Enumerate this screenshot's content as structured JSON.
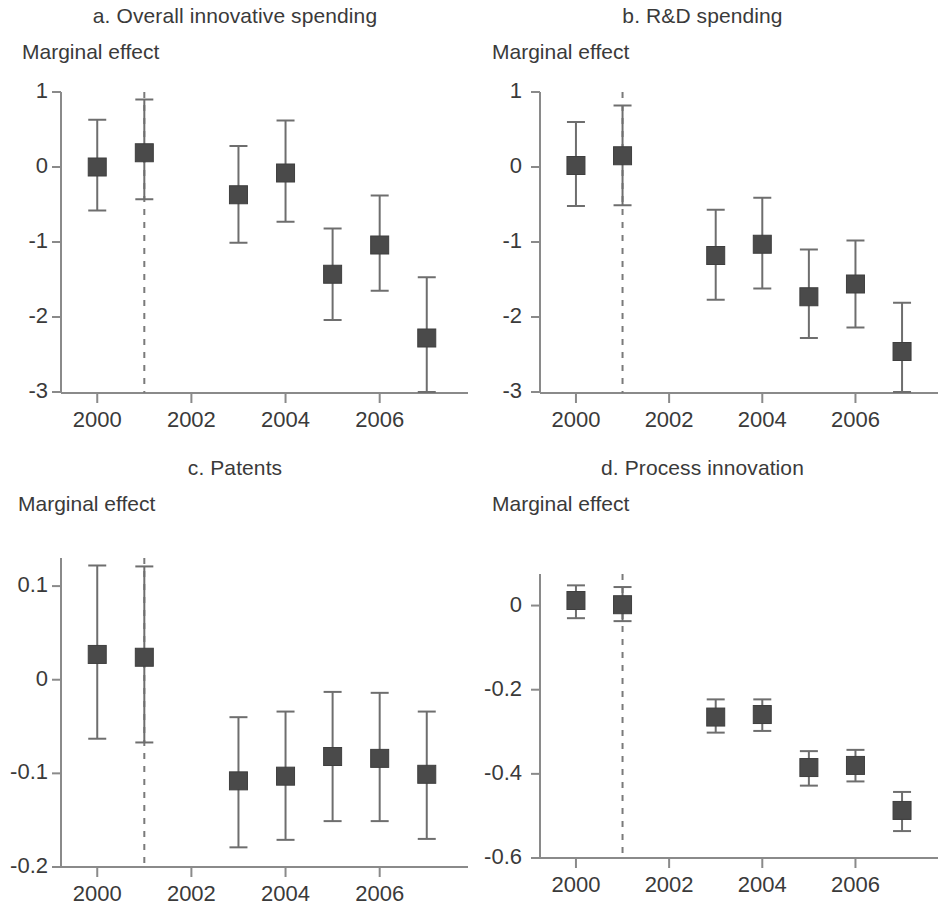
{
  "figure": {
    "marker_color": "#4a4a4a",
    "axis_color": "#8a8a8a",
    "error_bar_color": "#6e6e6e",
    "reference_line_color": "#7a7a7a",
    "background": "#ffffff"
  },
  "panels": [
    {
      "id": "a",
      "title": "a. Overall innovative spending",
      "ylabel": "Marginal effect"
    },
    {
      "id": "b",
      "title": "b. R&D spending",
      "ylabel": "Marginal effect"
    },
    {
      "id": "c",
      "title": "c. Patents",
      "ylabel": "Marginal effect"
    },
    {
      "id": "d",
      "title": "d. Process innovation",
      "ylabel": "Marginal effect"
    }
  ],
  "chart_data": [
    {
      "type": "scatter",
      "panel": "a",
      "title": "a. Overall innovative spending",
      "xlabel": "",
      "ylabel": "Marginal effect",
      "x": [
        2000,
        2001,
        2003,
        2004,
        2005,
        2006,
        2007
      ],
      "values": [
        0.0,
        0.19,
        -0.37,
        -0.08,
        -1.43,
        -1.04,
        -2.28
      ],
      "ci_low": [
        -0.58,
        -0.43,
        -1.01,
        -0.73,
        -2.04,
        -1.65,
        -3.07
      ],
      "ci_high": [
        0.63,
        0.9,
        0.28,
        0.62,
        -0.82,
        -0.38,
        -1.47
      ],
      "xlim": [
        1999.4,
        2007.6
      ],
      "ylim": [
        -3,
        1
      ],
      "xticks": [
        2000,
        2002,
        2004,
        2006
      ],
      "xtick_labels": [
        "2000",
        "2002",
        "2004",
        "2006"
      ],
      "yticks": [
        1,
        0,
        -1,
        -2,
        -3
      ],
      "ytick_labels": [
        "1",
        "0",
        "-1",
        "-2",
        "-3"
      ],
      "reference_line_x": 2001,
      "reference_line_style": "dashed",
      "grid": false,
      "legend": "none"
    },
    {
      "type": "scatter",
      "panel": "b",
      "title": "b. R&D spending",
      "xlabel": "",
      "ylabel": "Marginal effect",
      "x": [
        2000,
        2001,
        2003,
        2004,
        2005,
        2006,
        2007
      ],
      "values": [
        0.02,
        0.15,
        -1.18,
        -1.03,
        -1.73,
        -1.56,
        -2.46
      ],
      "ci_low": [
        -0.52,
        -0.51,
        -1.77,
        -1.62,
        -2.28,
        -2.14,
        -3.11
      ],
      "ci_high": [
        0.6,
        0.82,
        -0.57,
        -0.41,
        -1.1,
        -0.98,
        -1.81
      ],
      "xlim": [
        1999.4,
        2007.6
      ],
      "ylim": [
        -3,
        1
      ],
      "xticks": [
        2000,
        2002,
        2004,
        2006
      ],
      "xtick_labels": [
        "2000",
        "2002",
        "2004",
        "2006"
      ],
      "yticks": [
        1,
        0,
        -1,
        -2,
        -3
      ],
      "ytick_labels": [
        "1",
        "0",
        "-1",
        "-2",
        "-3"
      ],
      "reference_line_x": 2001,
      "reference_line_style": "dashed",
      "grid": false,
      "legend": "none"
    },
    {
      "type": "scatter",
      "panel": "c",
      "title": "c. Patents",
      "xlabel": "",
      "ylabel": "Marginal effect",
      "x": [
        2000,
        2001,
        2003,
        2004,
        2005,
        2006,
        2007
      ],
      "values": [
        0.027,
        0.024,
        -0.108,
        -0.103,
        -0.082,
        -0.084,
        -0.101
      ],
      "ci_low": [
        -0.063,
        -0.067,
        -0.179,
        -0.171,
        -0.151,
        -0.151,
        -0.17
      ],
      "ci_high": [
        0.122,
        0.121,
        -0.04,
        -0.034,
        -0.013,
        -0.014,
        -0.034
      ],
      "xlim": [
        1999.4,
        2007.6
      ],
      "ylim": [
        -0.2,
        0.13
      ],
      "xticks": [
        2000,
        2002,
        2004,
        2006
      ],
      "xtick_labels": [
        "2000",
        "2002",
        "2004",
        "2006"
      ],
      "yticks": [
        0.1,
        0,
        -0.1,
        -0.2
      ],
      "ytick_labels": [
        "0.1",
        "0",
        "-0.1",
        "-0.2"
      ],
      "reference_line_x": 2001,
      "reference_line_style": "dashed",
      "grid": false,
      "legend": "none"
    },
    {
      "type": "scatter",
      "panel": "d",
      "title": "d. Process innovation",
      "xlabel": "",
      "ylabel": "Marginal effect",
      "x": [
        2000,
        2001,
        2003,
        2004,
        2005,
        2006,
        2007
      ],
      "values": [
        0.012,
        0.002,
        -0.265,
        -0.259,
        -0.385,
        -0.38,
        -0.487
      ],
      "ci_low": [
        -0.03,
        -0.037,
        -0.302,
        -0.298,
        -0.428,
        -0.418,
        -0.536
      ],
      "ci_high": [
        0.048,
        0.044,
        -0.223,
        -0.223,
        -0.346,
        -0.343,
        -0.443
      ],
      "xlim": [
        1999.4,
        2007.6
      ],
      "ylim": [
        -0.6,
        0.075
      ],
      "xticks": [
        2000,
        2002,
        2004,
        2006
      ],
      "xtick_labels": [
        "2000",
        "2002",
        "2004",
        "2006"
      ],
      "yticks": [
        0,
        -0.2,
        -0.4,
        -0.6
      ],
      "ytick_labels": [
        "0",
        "-0.2",
        "-0.4",
        "-0.6"
      ],
      "reference_line_x": 2001,
      "reference_line_style": "dashed",
      "grid": false,
      "legend": "none"
    }
  ]
}
